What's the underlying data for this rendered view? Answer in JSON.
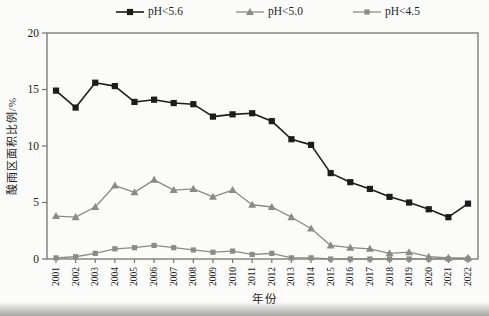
{
  "figure": {
    "ylabel": "酸雨区面积比例/%",
    "xlabel": "年份",
    "background": "#fbfbf9",
    "axis_color": "#76766f",
    "series_black": "#1c1c1c",
    "series_gray": "#8a8a87"
  },
  "chart_data": {
    "type": "line",
    "title": "",
    "xlabel": "年份",
    "ylabel": "酸雨区面积比例/%",
    "ylim": [
      0,
      20
    ],
    "yticks": [
      0,
      5,
      10,
      15,
      20
    ],
    "grid": false,
    "legend_position": "top",
    "categories": [
      "2001",
      "2002",
      "2003",
      "2004",
      "2005",
      "2006",
      "2007",
      "2008",
      "2009",
      "2010",
      "2011",
      "2012",
      "2013",
      "2014",
      "2015",
      "2016",
      "2017",
      "2018",
      "2019",
      "2020",
      "2021",
      "2022"
    ],
    "series": [
      {
        "name": "pH<5.6",
        "color": "#1c1c1c",
        "marker": "square",
        "marker_size": 6.2,
        "line_width": 1.6,
        "values": [
          14.9,
          13.4,
          15.6,
          15.3,
          13.9,
          14.1,
          13.8,
          13.7,
          12.6,
          12.8,
          12.9,
          12.2,
          10.6,
          10.1,
          7.6,
          6.8,
          6.2,
          5.5,
          5.0,
          4.4,
          3.7,
          4.9
        ]
      },
      {
        "name": "pH<5.0",
        "color": "#8a8a87",
        "marker": "triangle",
        "marker_size": 8,
        "line_width": 1.3,
        "values": [
          3.8,
          3.7,
          4.6,
          6.5,
          5.9,
          7.0,
          6.1,
          6.2,
          5.5,
          6.1,
          4.8,
          4.6,
          3.7,
          2.7,
          1.2,
          1.0,
          0.9,
          0.5,
          0.6,
          0.2,
          0.1,
          0.1
        ]
      },
      {
        "name": "pH<4.5",
        "color": "#8a8a87",
        "marker": "square",
        "marker_size": 5.2,
        "line_width": 1.3,
        "values": [
          0.1,
          0.2,
          0.5,
          0.9,
          1.0,
          1.2,
          1.0,
          0.8,
          0.6,
          0.7,
          0.4,
          0.5,
          0.1,
          0.1,
          0.0,
          0.0,
          0.0,
          0.0,
          0.0,
          0.0,
          0.0,
          0.0
        ]
      }
    ]
  }
}
